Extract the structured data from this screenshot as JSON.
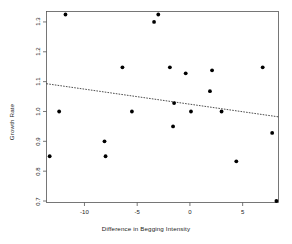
{
  "chart_data": {
    "type": "scatter",
    "title": "",
    "xlabel": "Difference in Begging Intensity",
    "ylabel": "Growth Rate",
    "xlim": [
      -13.6,
      8.4
    ],
    "ylim": [
      0.695,
      1.335
    ],
    "xticks": [
      -10,
      -5,
      0,
      5
    ],
    "xtick_labels": [
      "-10",
      "-5",
      "0",
      "5"
    ],
    "yticks": [
      0.7,
      0.8,
      0.9,
      1.0,
      1.1,
      1.2,
      1.3
    ],
    "ytick_labels": [
      "0.7",
      "0.8",
      "0.9",
      "1.0",
      "1.1",
      "1.2",
      "1.3"
    ],
    "grid": false,
    "legend": null,
    "point_color": "#000000",
    "line_color": "#000000",
    "frame_color": "#555555",
    "points": [
      {
        "x": -13.3,
        "y": 0.85
      },
      {
        "x": -12.4,
        "y": 1.0
      },
      {
        "x": -11.8,
        "y": 1.325
      },
      {
        "x": -8.1,
        "y": 0.9
      },
      {
        "x": -8.0,
        "y": 0.85
      },
      {
        "x": -6.4,
        "y": 1.148
      },
      {
        "x": -5.5,
        "y": 1.0
      },
      {
        "x": -3.4,
        "y": 1.3
      },
      {
        "x": -3.0,
        "y": 1.325
      },
      {
        "x": -1.9,
        "y": 1.148
      },
      {
        "x": -1.6,
        "y": 0.95
      },
      {
        "x": -1.5,
        "y": 1.028
      },
      {
        "x": -0.4,
        "y": 1.128
      },
      {
        "x": 0.1,
        "y": 1.0
      },
      {
        "x": 1.9,
        "y": 1.068
      },
      {
        "x": 2.1,
        "y": 1.138
      },
      {
        "x": 3.0,
        "y": 1.0
      },
      {
        "x": 4.4,
        "y": 0.833
      },
      {
        "x": 6.9,
        "y": 1.148
      },
      {
        "x": 7.8,
        "y": 0.928
      },
      {
        "x": 8.2,
        "y": 0.7
      }
    ],
    "trend_line": {
      "style": "dashed",
      "x_start": -13.6,
      "y_start": 1.093,
      "x_end": 8.4,
      "y_end": 0.982
    }
  }
}
